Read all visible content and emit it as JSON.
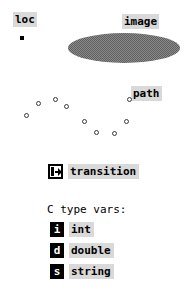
{
  "annotations": {
    "loc": {
      "label": "loc",
      "marker_icon": "point-marker-icon"
    },
    "image": {
      "label": "image",
      "region_icon": "filled-ellipse-region"
    },
    "path": {
      "label": "path",
      "node_icon": "open-circle-node",
      "node_count": 10
    }
  },
  "legend": {
    "transition": {
      "icon": "transition-icon",
      "label": "transition"
    },
    "type_vars": {
      "heading": "C type vars:",
      "items": [
        {
          "glyph": "i",
          "icon": "int-type-icon",
          "label": "int"
        },
        {
          "glyph": "d",
          "icon": "double-type-icon",
          "label": "double"
        },
        {
          "glyph": "s",
          "icon": "string-type-icon",
          "label": "string"
        }
      ]
    }
  },
  "colors": {
    "highlight": "#d9d9d9",
    "foreground": "#000000",
    "background": "#ffffff",
    "region_fill": "#8a8a8a",
    "node_stroke": "#3a3a3a"
  }
}
